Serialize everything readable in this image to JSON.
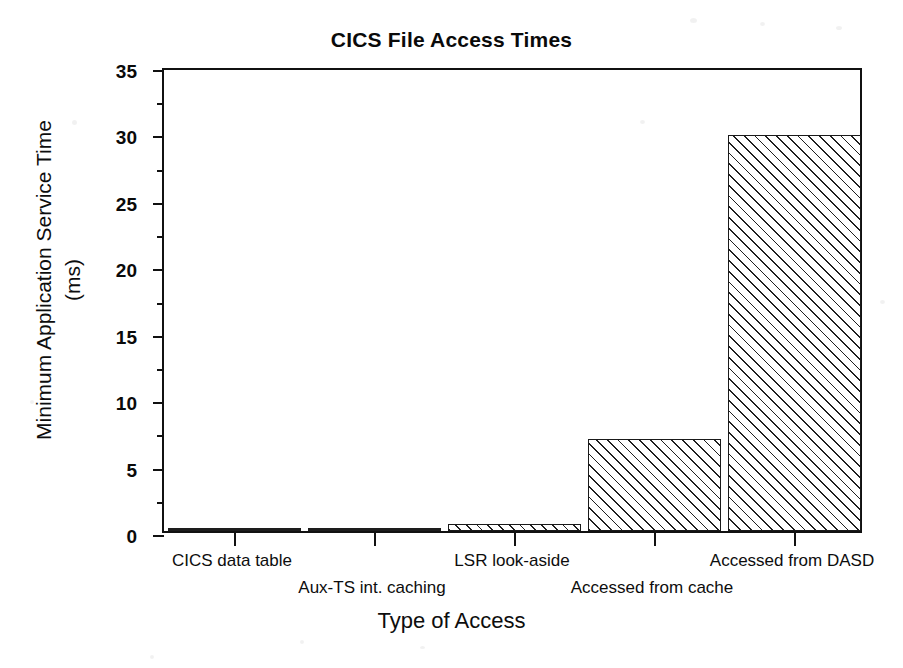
{
  "chart_data": {
    "type": "bar",
    "title": "CICS File Access Times",
    "xlabel": "Type of Access",
    "ylabel": "Minimum Application Service Time",
    "ylabel_unit": "(ms)",
    "ylabel_line1": "Minimum Application Service Time",
    "ylabel_line2": "(ms)",
    "categories": [
      "CICS data table",
      "Aux-TS int. caching",
      "LSR look-aside",
      "Accessed from cache",
      "Accessed from DASD"
    ],
    "values": [
      0.1,
      0.1,
      0.5,
      6.9,
      29.8
    ],
    "ylim": [
      0,
      35
    ],
    "ytick_labels": [
      "0",
      "5",
      "10",
      "15",
      "20",
      "25",
      "30",
      "35"
    ],
    "ytick_values": [
      0,
      5,
      10,
      15,
      20,
      25,
      30,
      35
    ],
    "yminor_values": [
      2.5,
      7.5,
      12.5,
      17.5,
      22.5,
      27.5,
      32.5
    ],
    "grid": false,
    "legend": "none",
    "bar_fill": "diagonal-hatch",
    "colors": {
      "ink": "#111111",
      "background": "#ffffff",
      "hatch": "#000000"
    }
  }
}
